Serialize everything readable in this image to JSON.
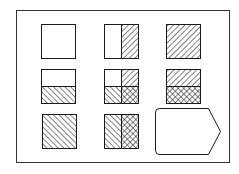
{
  "title": "Pattern matrix puzzle",
  "colors": {
    "stroke": "#1a1a1a",
    "background": "#ffffff"
  },
  "frame": {
    "x": 16,
    "y": 10,
    "w": 213,
    "h": 152
  },
  "cell_size": 34,
  "patterns": {
    "empty": "blank",
    "fwd": "forward-diagonal-hatch",
    "back": "back-diagonal-hatch",
    "cross": "cross-hatch"
  },
  "cells": [
    {
      "id": "r1c1",
      "row": 1,
      "col": 1,
      "x": 41,
      "y": 24,
      "split": "none",
      "parts": [
        "empty"
      ]
    },
    {
      "id": "r1c2",
      "row": 1,
      "col": 2,
      "x": 104,
      "y": 24,
      "split": "vertical",
      "parts": [
        "empty",
        "fwd"
      ]
    },
    {
      "id": "r1c3",
      "row": 1,
      "col": 3,
      "x": 166,
      "y": 24,
      "split": "none",
      "parts": [
        "fwd"
      ]
    },
    {
      "id": "r2c1",
      "row": 2,
      "col": 1,
      "x": 41,
      "y": 69,
      "split": "horizontal",
      "parts": [
        "empty",
        "back"
      ]
    },
    {
      "id": "r2c2",
      "row": 2,
      "col": 2,
      "x": 104,
      "y": 69,
      "split": "quad",
      "parts": [
        "empty",
        "fwd",
        "back",
        "cross"
      ]
    },
    {
      "id": "r2c3",
      "row": 2,
      "col": 3,
      "x": 166,
      "y": 69,
      "split": "horizontal",
      "parts": [
        "fwd",
        "cross"
      ]
    },
    {
      "id": "r3c1",
      "row": 3,
      "col": 1,
      "x": 42,
      "y": 114,
      "split": "none",
      "parts": [
        "back"
      ]
    },
    {
      "id": "r3c2",
      "row": 3,
      "col": 2,
      "x": 104,
      "y": 114,
      "split": "vertical",
      "parts": [
        "back",
        "cross"
      ]
    }
  ],
  "answer_slot": {
    "label": "answer-slot",
    "x": 155,
    "y": 108,
    "w": 65,
    "h": 46,
    "shape": "tag"
  }
}
